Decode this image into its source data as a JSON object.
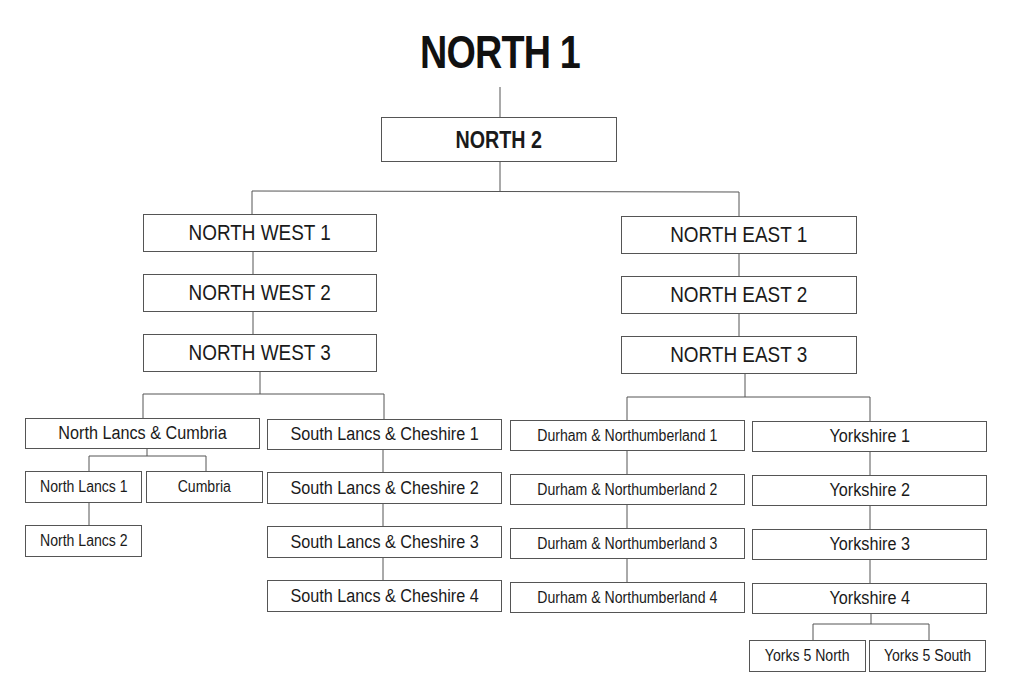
{
  "title": "NORTH 1",
  "nodes": {
    "north2": "NORTH 2",
    "nw1": "NORTH WEST 1",
    "nw2": "NORTH WEST 2",
    "nw3": "NORTH WEST 3",
    "ne1": "NORTH EAST 1",
    "ne2": "NORTH EAST 2",
    "ne3": "NORTH EAST 3",
    "nlc": "North Lancs & Cumbria",
    "nl1": "North Lancs 1",
    "cumbria": "Cumbria",
    "nl2": "North Lancs 2",
    "slc1": "South Lancs & Cheshire 1",
    "slc2": "South Lancs & Cheshire 2",
    "slc3": "South Lancs & Cheshire 3",
    "slc4": "South Lancs & Cheshire 4",
    "dn1": "Durham & Northumberland 1",
    "dn2": "Durham & Northumberland 2",
    "dn3": "Durham & Northumberland 3",
    "dn4": "Durham & Northumberland 4",
    "y1": "Yorkshire 1",
    "y2": "Yorkshire 2",
    "y3": "Yorkshire 3",
    "y4": "Yorkshire 4",
    "y5n": "Yorks 5 North",
    "y5s": "Yorks 5 South"
  }
}
